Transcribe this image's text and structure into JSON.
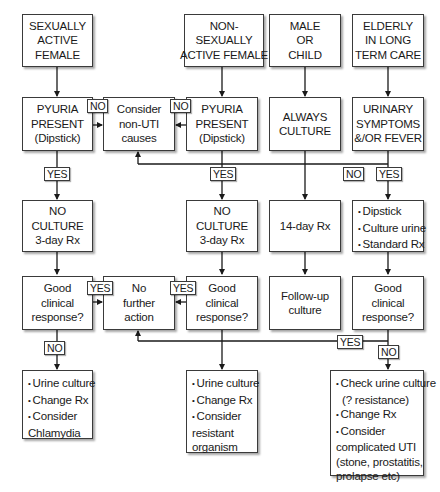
{
  "row1": {
    "sexually_active_female": [
      "SEXUALLY",
      "ACTIVE",
      "FEMALE"
    ],
    "non_sexually_active_female": [
      "NON-",
      "SEXUALLY",
      "ACTIVE FEMALE"
    ],
    "male_or_child": [
      "MALE",
      "OR",
      "CHILD"
    ],
    "elderly_long_term_care": [
      "ELDERLY",
      "IN LONG",
      "TERM CARE"
    ]
  },
  "row2": {
    "pyuria_1": [
      "PYURIA",
      "PRESENT",
      "(Dipstick)"
    ],
    "consider_non_uti": [
      "Consider",
      "non-UTI",
      "causes"
    ],
    "pyuria_2": [
      "PYURIA",
      "PRESENT",
      "(Dipstick)"
    ],
    "always_culture": [
      "ALWAYS",
      "CULTURE"
    ],
    "urinary_symptoms": [
      "URINARY",
      "SYMPTOMS",
      "&/OR FEVER"
    ]
  },
  "row3": {
    "no_culture_1": [
      "NO",
      "CULTURE",
      "3-day Rx"
    ],
    "no_culture_2": [
      "NO",
      "CULTURE",
      "3-day Rx"
    ],
    "fourteen_day": [
      "14-day Rx"
    ],
    "dipstick_culture": [
      "Dipstick",
      "Culture urine",
      "Standard Rx"
    ]
  },
  "row4": {
    "good_response_1": [
      "Good",
      "clinical",
      "response?"
    ],
    "no_further_action": [
      "No",
      "further",
      "action"
    ],
    "good_response_2": [
      "Good",
      "clinical",
      "response?"
    ],
    "follow_up": [
      "Follow-up",
      "culture"
    ],
    "good_response_3": [
      "Good",
      "clinical",
      "response?"
    ]
  },
  "row5": {
    "outcome_1": [
      "Urine culture",
      "Change Rx",
      "Consider",
      "Chlamydia"
    ],
    "outcome_2": [
      "Urine culture",
      "Change Rx",
      "Consider",
      "resistant",
      "organism"
    ],
    "outcome_3": [
      "Check urine culture",
      "(? resistance)",
      "Change Rx",
      "Consider",
      "complicated UTI",
      "(stone, prostatitis,",
      "prolapse etc)"
    ]
  },
  "labels": {
    "no": "NO",
    "yes": "YES"
  },
  "colors": {
    "line": "#1a1a1a",
    "box_border": "#3a3a3a",
    "background": "#ffffff"
  }
}
